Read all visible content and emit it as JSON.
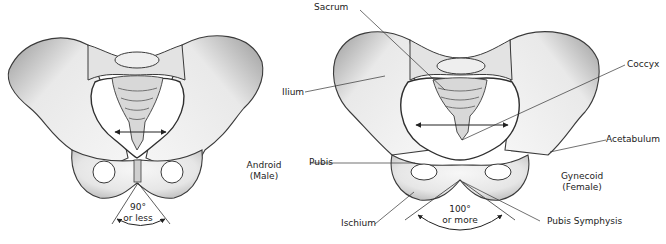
{
  "figure": {
    "left": {
      "type_label": "Android",
      "sex_label": "(Male)",
      "angle_value": "90°",
      "angle_qualifier": "or less"
    },
    "right": {
      "type_label": "Gynecoid",
      "sex_label": "(Female)",
      "angle_value": "100°",
      "angle_qualifier": "or more"
    },
    "labels": {
      "sacrum": "Sacrum",
      "coccyx": "Coccyx",
      "ilium": "Ilium",
      "acetabulum": "Acetabulum",
      "pubis": "Pubis",
      "ischium": "Ischium",
      "pubis_symphysis": "Pubis Symphysis"
    },
    "colors": {
      "bone_fill": "#ececec",
      "bone_shade": "#bdbdbd",
      "outline": "#3a3a3a",
      "leader": "#333333"
    }
  }
}
